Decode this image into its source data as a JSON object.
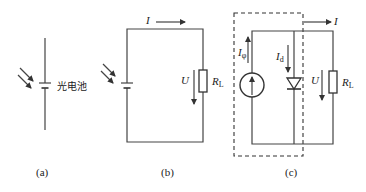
{
  "diagram": {
    "panels": [
      {
        "id": "a",
        "caption": "(a)",
        "component_label": "光电池",
        "elements": [
          "photocell-symbol",
          "light-arrows"
        ]
      },
      {
        "id": "b",
        "caption": "(b)",
        "current_label": "I",
        "voltage_label": "U",
        "resistor_label_main": "R",
        "resistor_label_sub": "L",
        "elements": [
          "photocell-symbol",
          "light-arrows",
          "load-resistor",
          "current-arrow",
          "voltage-arrow"
        ]
      },
      {
        "id": "c",
        "caption": "(c)",
        "current_label": "I",
        "photo_current_main": "I",
        "photo_current_sub": "φ",
        "diode_current_main": "I",
        "diode_current_sub": "d",
        "voltage_label": "U",
        "resistor_label_main": "R",
        "resistor_label_sub": "L",
        "elements": [
          "current-source",
          "diode",
          "load-resistor",
          "dashed-equivalent-box",
          "current-arrows",
          "voltage-arrow"
        ]
      }
    ],
    "colors": {
      "line": "#444444",
      "text": "#222222",
      "background": "#ffffff"
    }
  }
}
